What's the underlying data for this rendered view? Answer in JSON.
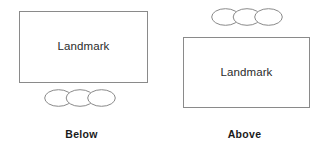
{
  "figure": {
    "background_color": "#ffffff",
    "stroke_color": "#8a8a8a",
    "text_color": "#2b2b2b",
    "caption_color": "#1a1a1a"
  },
  "panels": [
    {
      "id": "below",
      "caption": "Below",
      "landmark_label": "Landmark",
      "ellipse_count": 3,
      "ellipse_position": "below-rectangle"
    },
    {
      "id": "above",
      "caption": "Above",
      "landmark_label": "Landmark",
      "ellipse_count": 3,
      "ellipse_position": "above-rectangle"
    }
  ]
}
